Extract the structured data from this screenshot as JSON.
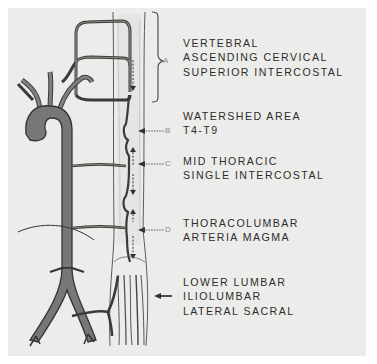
{
  "diagram": {
    "regions": [
      {
        "marker": "A",
        "indicator": "brace",
        "lines": [
          "VERTEBRAL",
          "ASCENDING CERVICAL",
          "SUPERIOR INTERCOSTAL"
        ]
      },
      {
        "marker": "B",
        "indicator": "dotted-arrow",
        "lines": [
          "WATERSHED AREA",
          "T4-T9"
        ]
      },
      {
        "marker": "C",
        "indicator": "dotted-arrow",
        "lines": [
          "MID THORACIC",
          "SINGLE INTERCOSTAL"
        ]
      },
      {
        "marker": "D",
        "indicator": "dotted-arrow",
        "lines": [
          "THORACOLUMBAR",
          "ARTERIA MAGMA"
        ]
      },
      {
        "marker": "",
        "indicator": "solid-arrow",
        "lines": [
          "LOWER LUMBAR",
          "ILIOLUMBAR",
          "LATERAL SACRAL"
        ]
      }
    ],
    "colors": {
      "background": "#ececea",
      "vessel_fill": "#7a7a78",
      "vessel_stroke": "#3a3a38",
      "text": "#2c2c2c",
      "marker": "#8a8a8a"
    }
  }
}
